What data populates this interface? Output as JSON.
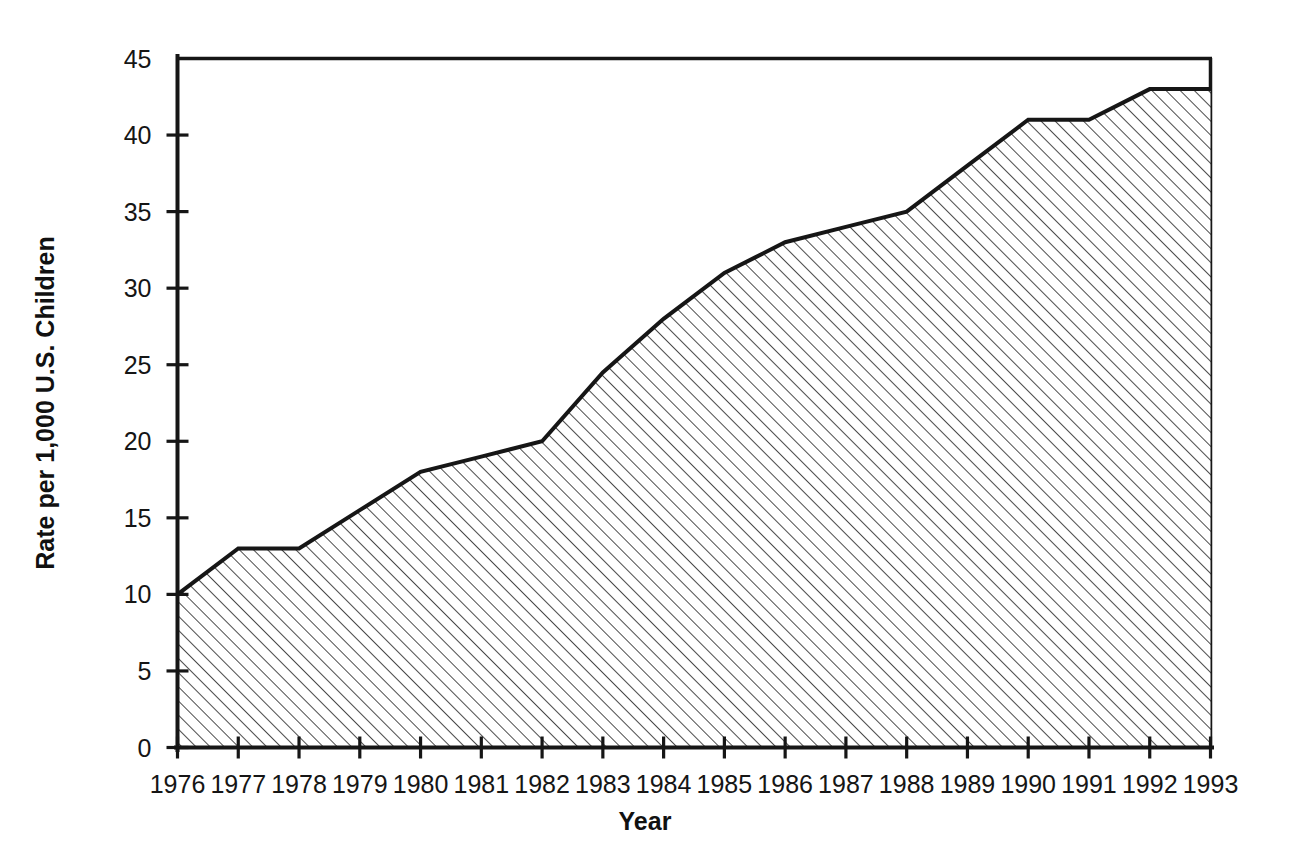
{
  "chart_data": {
    "type": "area",
    "title": "",
    "subtitle": "",
    "xlabel": "Year",
    "ylabel": "Rate per 1,000 U.S. Children",
    "categories": [
      "1976",
      "1977",
      "1978",
      "1979",
      "1980",
      "1981",
      "1982",
      "1983",
      "1984",
      "1985",
      "1986",
      "1987",
      "1988",
      "1989",
      "1990",
      "1991",
      "1992",
      "1993"
    ],
    "values": [
      10,
      13,
      13,
      15.5,
      18,
      19,
      20,
      24.5,
      28,
      31,
      33,
      34,
      35,
      38,
      41,
      41,
      43,
      43
    ],
    "series": [
      {
        "name": "Rate per 1,000 U.S. Children",
        "values": [
          10,
          13,
          13,
          15.5,
          18,
          19,
          20,
          24.5,
          28,
          31,
          33,
          34,
          35,
          38,
          41,
          41,
          43,
          43
        ]
      }
    ],
    "x": [
      1976,
      1977,
      1978,
      1979,
      1980,
      1981,
      1982,
      1983,
      1984,
      1985,
      1986,
      1987,
      1988,
      1989,
      1990,
      1991,
      1992,
      1993
    ],
    "xlim": [
      1976,
      1993
    ],
    "ylim": [
      0,
      45
    ],
    "yticks": [
      0,
      5,
      10,
      15,
      20,
      25,
      30,
      35,
      40,
      45
    ],
    "ytick_labels": [
      "0",
      "5",
      "10",
      "15",
      "20",
      "25",
      "30",
      "35",
      "40",
      "45"
    ],
    "xtick_labels": [
      "1976",
      "1977",
      "1978",
      "1979",
      "1980",
      "1981",
      "1982",
      "1983",
      "1984",
      "1985",
      "1986",
      "1987",
      "1988",
      "1989",
      "1990",
      "1991",
      "1992",
      "1993"
    ],
    "grid": false,
    "legend": false,
    "legend_position": "none",
    "fill_pattern": "diagonal-hatch-45",
    "colors": {
      "line": "#161616",
      "hatch": "#2b2b2b",
      "background": "#ffffff",
      "axis": "#161616",
      "text": "#111111"
    },
    "annotations": []
  },
  "axes": {
    "y_title": "Rate per 1,000 U.S. Children",
    "x_title": "Year"
  }
}
